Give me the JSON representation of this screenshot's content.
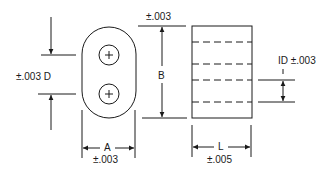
{
  "diagram": {
    "colors": {
      "line": "#1a1a1a",
      "background": "#ffffff"
    },
    "end_view": {
      "shape": "oval-two-hole",
      "dimension_A": {
        "label": "A",
        "tolerance": "±.003"
      },
      "dimension_D": {
        "label": "D",
        "tolerance": "±.003",
        "text": "±.003 D"
      },
      "dimension_B": {
        "label": "B",
        "tolerance": "±.003"
      },
      "holes": [
        {
          "marker": "+"
        },
        {
          "marker": "+"
        }
      ]
    },
    "side_view": {
      "shape": "rectangle-with-hidden-bores",
      "dimension_L": {
        "label": "L",
        "tolerance": "±.005"
      },
      "dimension_ID": {
        "label": "ID",
        "tolerance": "±.003",
        "text": "ID ±.003"
      }
    }
  }
}
